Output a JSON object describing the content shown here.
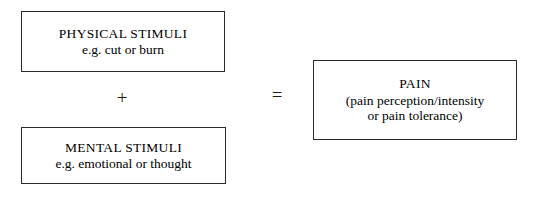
{
  "diagram": {
    "type": "equation-diagram",
    "background_color": "#ffffff",
    "border_color": "#2b2b2b",
    "text_color": "#000000",
    "boxes": [
      {
        "id": "physical-stimuli",
        "title": "PHYSICAL STIMULI",
        "subtitle": "e.g. cut or burn"
      },
      {
        "id": "mental-stimuli",
        "title": "MENTAL STIMULI",
        "subtitle": "e.g. emotional or thought"
      },
      {
        "id": "pain",
        "title": "PAIN",
        "subtitle_line1": "(pain perception/intensity",
        "subtitle_line2": "or pain tolerance)"
      }
    ],
    "operators": {
      "plus": "+",
      "equals": "="
    }
  }
}
